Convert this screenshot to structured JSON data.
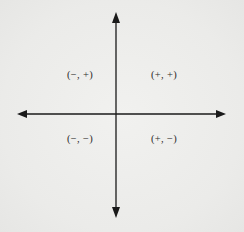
{
  "diagram": {
    "type": "coordinate-plane-quadrant-signs",
    "colors": {
      "background": "#eeeeec",
      "axis": "#1a1a1a",
      "text": "#2a2a2a"
    },
    "axes": {
      "horizontal": {
        "x1": 17,
        "x2": 226,
        "y": 114,
        "arrows": "both"
      },
      "vertical": {
        "x": 116,
        "y1": 12,
        "y2": 218,
        "arrows": "both"
      }
    },
    "quadrants": [
      {
        "name": "quadrant-II",
        "label": "(−, +)",
        "x": 80,
        "y": 74
      },
      {
        "name": "quadrant-I",
        "label": "(+, +)",
        "x": 164,
        "y": 74
      },
      {
        "name": "quadrant-III",
        "label": "(−, −)",
        "x": 80,
        "y": 138
      },
      {
        "name": "quadrant-IV",
        "label": "(+, −)",
        "x": 164,
        "y": 138
      }
    ]
  }
}
